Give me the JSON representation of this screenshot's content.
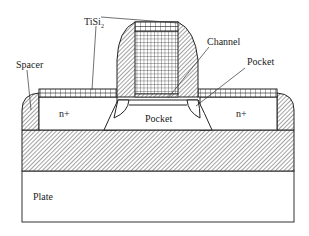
{
  "diagram": {
    "type": "MOSFET cross-section",
    "labels": {
      "tisi2": "TiSi",
      "tisi2_subscript": "2",
      "spacer": "Spacer",
      "channel": "Channel",
      "pocket_right": "Pocket",
      "pocket_center": "Pocket",
      "source": "n+",
      "drain": "n+",
      "plate": "Plate"
    },
    "colors": {
      "stroke": "#222222",
      "hatch": "#555555",
      "background": "#ffffff"
    }
  }
}
